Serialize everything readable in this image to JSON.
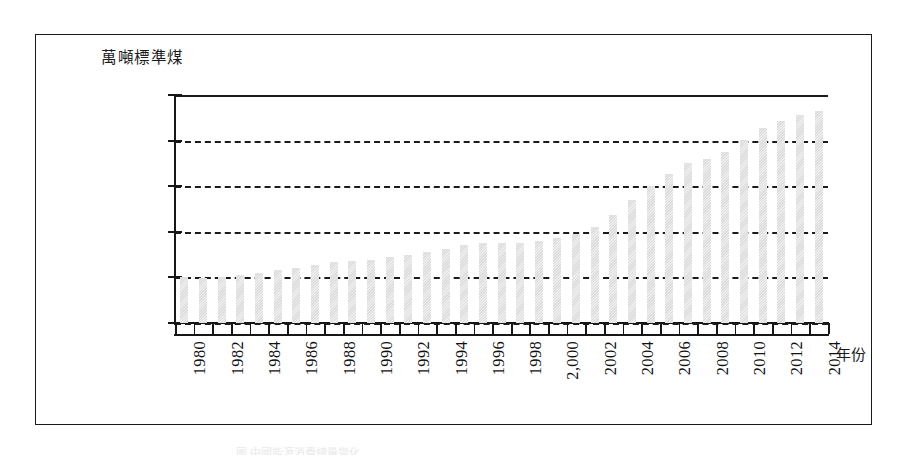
{
  "figure": {
    "y_axis_unit_label": "萬噸標準煤",
    "x_axis_title": "年份",
    "caption_remnant": "圖 中國能源消費總量變化"
  },
  "chart_data": {
    "type": "bar",
    "title": "",
    "xlabel": "年份",
    "ylabel": "萬噸標準煤",
    "ylim": [
      -40000,
      460000
    ],
    "grid": true,
    "legend_position": "none",
    "y_tick_labels": [
      "460,000.00",
      "360,000.00",
      "260,000.00",
      "160,000.00",
      "60,000.00",
      "(40,000.00)"
    ],
    "y_tick_values": [
      460000,
      360000,
      260000,
      160000,
      60000,
      -40000
    ],
    "x_tick_labels_shown": [
      "1980",
      "1982",
      "1984",
      "1986",
      "1988",
      "1990",
      "1992",
      "1994",
      "1996",
      "1998",
      "2,000",
      "2002",
      "2004",
      "2006",
      "2008",
      "2010",
      "2012",
      "2014"
    ],
    "categories": [
      "1980",
      "1981",
      "1982",
      "1983",
      "1984",
      "1985",
      "1986",
      "1987",
      "1988",
      "1989",
      "1990",
      "1991",
      "1992",
      "1993",
      "1994",
      "1995",
      "1996",
      "1997",
      "1998",
      "1999",
      "2000",
      "2001",
      "2002",
      "2003",
      "2004",
      "2005",
      "2006",
      "2007",
      "2008",
      "2009",
      "2010",
      "2011",
      "2012",
      "2013",
      "2014"
    ],
    "values": [
      60300,
      59500,
      62000,
      66000,
      70000,
      76700,
      80900,
      86600,
      93000,
      96900,
      98700,
      103800,
      109200,
      115900,
      122700,
      131200,
      135200,
      135900,
      136200,
      140600,
      146900,
      155500,
      169600,
      197100,
      230300,
      261400,
      286500,
      311400,
      320600,
      336100,
      360600,
      387100,
      402100,
      416900,
      426000
    ],
    "bar_color": "#dedede"
  }
}
